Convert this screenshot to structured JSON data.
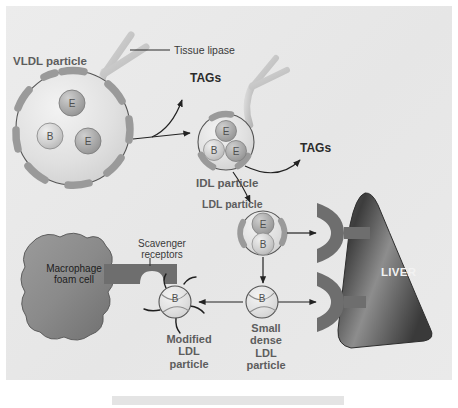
{
  "figure": {
    "background_color": "#e9e9e9",
    "label_color": "#5d5d5d",
    "dark_label_color": "#2b2b2b",
    "liver_color": "#4a4a4a",
    "particle_color": "#d6d6d6",
    "apo_color": "#a8a8a8",
    "receptor_color": "#6e6e6e"
  },
  "labels": {
    "vldl_particle": "VLDL particle",
    "tissue_lipase": "Tissue lipase",
    "tags_1": "TAGs",
    "tags_2": "TAGs",
    "idl_particle": "IDL particle",
    "ldl_particle": "LDL particle",
    "liver": "LIVER",
    "scavenger_receptors": "Scavenger\nreceptors",
    "macrophage_foam_cell": "Macrophage\nfoam cell",
    "modified_ldl_particle": "Modified\nLDL\nparticle",
    "small_dense_ldl_particle": "Small\ndense\nLDL\nparticle"
  },
  "particles": {
    "vldl": {
      "name": "VLDL particle",
      "apolipoproteins": [
        "E",
        "B",
        "E"
      ],
      "surface_segments": 11,
      "radius": 62
    },
    "idl": {
      "name": "IDL particle",
      "apolipoproteins": [
        "E",
        "B",
        "E"
      ],
      "surface_segments": 4,
      "radius": 30
    },
    "ldl": {
      "name": "LDL particle",
      "apolipoproteins": [
        "E",
        "B"
      ],
      "surface_segments": 2,
      "radius": 23
    },
    "small_dense_ldl": {
      "name": "Small dense LDL particle",
      "apolipoproteins": [
        "B"
      ],
      "radius": 16
    },
    "modified_ldl": {
      "name": "Modified LDL particle",
      "apolipoproteins": [
        "B"
      ],
      "radius": 16,
      "spikes": 5
    }
  },
  "receptors": {
    "ldl_receptor_upper": "LDL receptor",
    "ldl_receptor_lower": "LDL receptor",
    "scavenger_receptor": "Scavenger receptor"
  },
  "enzymes": {
    "lipase_1": "Tissue lipase",
    "lipase_2": "Tissue lipase"
  },
  "flow_arrows": [
    "VLDL to IDL",
    "VLDL to TAGs",
    "IDL to TAGs",
    "IDL to LDL",
    "LDL to liver receptor",
    "LDL to small dense LDL",
    "Small dense LDL to liver receptor",
    "Small dense LDL to modified LDL",
    "Modified LDL to macrophage scavenger receptor"
  ]
}
